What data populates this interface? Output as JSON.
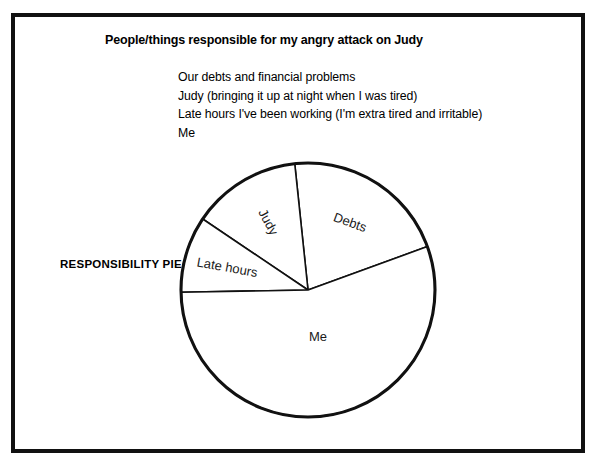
{
  "worksheet": {
    "title": "People/things responsible for my angry attack on Judy",
    "caption": "RESPONSIBILITY PIE",
    "responsible_items": [
      "Our debts and financial problems",
      "Judy (bringing it up at night when I was tired)",
      "Late hours I've been working (I'm extra tired and irritable)",
      "Me"
    ]
  },
  "chart_data": {
    "type": "pie",
    "title": "People/things responsible for my angry attack on Judy",
    "categories": [
      "Debts",
      "Me",
      "Late hours",
      "Judy"
    ],
    "values": [
      21,
      55,
      10,
      14
    ],
    "unit": "percent",
    "labels": [
      "Debts",
      "Me",
      "Late hours",
      "Judy"
    ],
    "slices": [
      {
        "label": "Debts",
        "value": 21,
        "start_angle_deg": 20,
        "end_angle_deg": 96,
        "label_angle_deg": 58,
        "label_rotation_deg": 20,
        "label_radius_frac": 0.62
      },
      {
        "label": "Judy",
        "value": 14,
        "start_angle_deg": 96,
        "end_angle_deg": 146,
        "label_angle_deg": 121,
        "label_rotation_deg": 62,
        "label_radius_frac": 0.62
      },
      {
        "label": "Late hours",
        "value": 10,
        "start_angle_deg": 146,
        "end_angle_deg": 181,
        "label_angle_deg": 165,
        "label_rotation_deg": 10,
        "label_radius_frac": 0.66
      },
      {
        "label": "Me",
        "value": 55,
        "start_angle_deg": 181,
        "end_angle_deg": 380,
        "label_angle_deg": 282,
        "label_rotation_deg": 0,
        "label_radius_frac": 0.38
      }
    ],
    "geometry": {
      "cx": 136,
      "cy": 137,
      "r": 127
    },
    "legend": "none",
    "grid": false,
    "colors": {
      "fill": "#ffffff",
      "stroke": "#111111",
      "text": "#1a1a1a"
    }
  }
}
